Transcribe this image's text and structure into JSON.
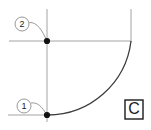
{
  "drawing": {
    "type": "technical-cad-sketch",
    "background_color": "#ffffff",
    "construction_line_color": "#9a9a9a",
    "arc_color": "#3c3c3c",
    "leader_color": "#8c8c8c",
    "point_color": "#111111",
    "balloons": [
      {
        "label": "1",
        "center_x": 24,
        "center_y": 106,
        "radius": 7,
        "points_to_x": 47,
        "points_to_y": 115
      },
      {
        "label": "2",
        "center_x": 22,
        "center_y": 24,
        "radius": 7,
        "points_to_x": 47,
        "points_to_y": 41
      }
    ],
    "points": [
      {
        "name": "upper-node",
        "x": 47,
        "y": 41
      },
      {
        "name": "lower-node",
        "x": 47,
        "y": 115
      }
    ],
    "construction_lines": [
      {
        "name": "vertical-left",
        "x1": 47,
        "y1": 9,
        "x2": 47,
        "y2": 122
      },
      {
        "name": "vertical-right",
        "x1": 131,
        "y1": 9,
        "x2": 131,
        "y2": 42
      },
      {
        "name": "horizontal-upper",
        "x1": 9,
        "y1": 41,
        "x2": 131,
        "y2": 41
      },
      {
        "name": "horizontal-lower",
        "x1": 8,
        "y1": 115,
        "x2": 47,
        "y2": 115
      }
    ],
    "arc": {
      "name": "quarter-arc",
      "start_x": 47,
      "start_y": 115,
      "end_x": 131,
      "end_y": 41,
      "radius": 84,
      "sweep": "concave-up-right"
    },
    "label_box": {
      "letter": "C",
      "x": 125,
      "y": 100,
      "width": 18,
      "height": 19
    }
  }
}
